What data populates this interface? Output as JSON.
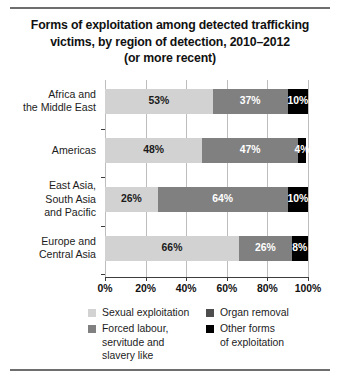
{
  "title": {
    "line1": "Forms of exploitation among detected trafficking",
    "line2": "victims, by region of detection, 2010–2012",
    "line3": "(or more recent)"
  },
  "colors": {
    "sexual_exploitation": "#d2d2d2",
    "forced_labour": "#808080",
    "organ_removal": "#4d4d4d",
    "other_forms": "#000000",
    "axis": "#3c3c3c",
    "grid": "#bdbdbd",
    "rule": "#6e6e6e"
  },
  "axis": {
    "ticks": [
      "0%",
      "20%",
      "40%",
      "60%",
      "80%",
      "100%"
    ]
  },
  "legend": {
    "items": [
      {
        "label": "Sexual exploitation",
        "label2": "",
        "swatch": "sexual_exploitation",
        "column": "left"
      },
      {
        "label": "Forced labour,",
        "label2": "servitude and",
        "label3": "slavery like",
        "swatch": "forced_labour",
        "column": "left"
      },
      {
        "label": "Organ removal",
        "label2": "",
        "swatch": "organ_removal",
        "column": "right"
      },
      {
        "label": "Other forms",
        "label2": "of exploitation",
        "swatch": "other_forms",
        "column": "right"
      }
    ]
  },
  "chart_data": {
    "type": "bar",
    "orientation": "horizontal",
    "stacked": true,
    "title": "Forms of exploitation among detected trafficking victims, by region of detection, 2010–2012 (or more recent)",
    "xlabel": "",
    "ylabel": "",
    "xlim": [
      0,
      100
    ],
    "xticks": [
      0,
      20,
      40,
      60,
      80,
      100
    ],
    "grid": true,
    "legend_position": "bottom",
    "categories": [
      "Africa and the Middle East",
      "Americas",
      "East Asia, South Asia and Pacific",
      "Europe and Central Asia"
    ],
    "series": [
      {
        "name": "Sexual exploitation",
        "values": [
          53,
          48,
          26,
          66
        ]
      },
      {
        "name": "Forced labour, servitude and slavery like",
        "values": [
          37,
          47,
          64,
          26
        ]
      },
      {
        "name": "Other forms of exploitation",
        "values": [
          10,
          4,
          10,
          8
        ]
      }
    ],
    "data_labels": [
      [
        "53%",
        "37%",
        "10%"
      ],
      [
        "48%",
        "47%",
        "4%"
      ],
      [
        "26%",
        "64%",
        "10%"
      ],
      [
        "66%",
        "26%",
        "8%"
      ]
    ]
  },
  "rows": [
    {
      "label_line1": "Africa and",
      "label_line2": "the Middle East",
      "label_line3": "",
      "segments": [
        {
          "value": 53,
          "label": "53%",
          "color": "sexual_exploitation",
          "text": "#1a1a1a"
        },
        {
          "value": 37,
          "label": "37%",
          "color": "forced_labour",
          "text": "#ffffff"
        },
        {
          "value": 10,
          "label": "10%",
          "color": "other_forms",
          "text": "#ffffff"
        }
      ]
    },
    {
      "label_line1": "Americas",
      "label_line2": "",
      "label_line3": "",
      "segments": [
        {
          "value": 48,
          "label": "48%",
          "color": "sexual_exploitation",
          "text": "#1a1a1a"
        },
        {
          "value": 47,
          "label": "47%",
          "color": "forced_labour",
          "text": "#ffffff"
        },
        {
          "value": 4,
          "label": "4%",
          "color": "other_forms",
          "text": "#ffffff"
        }
      ]
    },
    {
      "label_line1": "East Asia,",
      "label_line2": "South Asia",
      "label_line3": "and Pacific",
      "segments": [
        {
          "value": 26,
          "label": "26%",
          "color": "sexual_exploitation",
          "text": "#1a1a1a"
        },
        {
          "value": 64,
          "label": "64%",
          "color": "forced_labour",
          "text": "#ffffff"
        },
        {
          "value": 10,
          "label": "10%",
          "color": "other_forms",
          "text": "#ffffff"
        }
      ]
    },
    {
      "label_line1": "Europe and",
      "label_line2": "Central Asia",
      "label_line3": "",
      "segments": [
        {
          "value": 66,
          "label": "66%",
          "color": "sexual_exploitation",
          "text": "#1a1a1a"
        },
        {
          "value": 26,
          "label": "26%",
          "color": "forced_labour",
          "text": "#ffffff"
        },
        {
          "value": 8,
          "label": "8%",
          "color": "other_forms",
          "text": "#ffffff"
        }
      ]
    }
  ]
}
